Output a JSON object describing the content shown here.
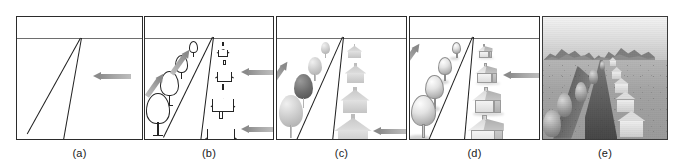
{
  "figure": {
    "width_px": 684,
    "height_px": 167,
    "background_color": "#ffffff",
    "line_color": "#1d1d1d",
    "horizon_color": "#6e6e6e",
    "arrow_color": "#8d8d8d"
  },
  "panels": [
    {
      "id": "a",
      "caption": "(a)",
      "description": "Perspective wireframe: horizon line with two converging road edges meeting at a vanishing point",
      "x": 16,
      "width": 127,
      "style": "wireframe",
      "has_horizon": true,
      "has_road": true,
      "objects": {
        "trees": 0,
        "houses": 0
      },
      "arrows": [
        {
          "type": "horizontal",
          "direction": "left",
          "label": "view-direction-arrow"
        }
      ]
    },
    {
      "id": "b",
      "caption": "(b)",
      "description": "Line-art stage: outline trees on the left of the road, outline houses on the right",
      "x": 144,
      "width": 130,
      "style": "line-art",
      "has_horizon": true,
      "has_road": true,
      "objects": {
        "trees": 4,
        "houses": 4
      },
      "arrows": [
        {
          "type": "diagonal",
          "direction": "down-right",
          "label": "light-arrow-upper"
        },
        {
          "type": "diagonal",
          "direction": "down-right",
          "label": "light-arrow-lower"
        },
        {
          "type": "horizontal",
          "direction": "left",
          "label": "view-arrow-upper"
        },
        {
          "type": "horizontal",
          "direction": "left",
          "label": "view-arrow-lower"
        }
      ]
    },
    {
      "id": "c",
      "caption": "(c)",
      "description": "Soft silhouette / flat shading stage: grey filled trees and houses, one tree darkly shaded",
      "x": 276,
      "width": 131,
      "style": "soft-silhouette",
      "has_horizon": true,
      "has_road": true,
      "objects": {
        "trees": 4,
        "houses": 4
      },
      "arrows": [
        {
          "type": "diagonal",
          "direction": "down-right",
          "label": "light-arrow"
        },
        {
          "type": "horizontal",
          "direction": "left",
          "label": "view-arrow"
        }
      ]
    },
    {
      "id": "d",
      "caption": "(d)",
      "description": "Fully shaded 3D stage: volumetric trees and gabled houses with cast shadows",
      "x": 409,
      "width": 131,
      "style": "shaded-3d",
      "has_horizon": true,
      "has_road": true,
      "objects": {
        "trees": 4,
        "houses": 4
      },
      "arrows": [
        {
          "type": "diagonal",
          "direction": "down-right",
          "label": "light-arrow"
        },
        {
          "type": "horizontal",
          "direction": "left",
          "label": "view-arrow"
        }
      ]
    },
    {
      "id": "e",
      "caption": "(e)",
      "description": "Final photorealistic grayscale render: gradient sky, mountain range on the horizon, textured speckled ground, dark road receding to the vanishing point, trees at left casting long shadows and light buildings at right",
      "x": 542,
      "width": 126,
      "style": "photorealistic",
      "has_horizon": true,
      "has_road": true,
      "objects": {
        "trees": 5,
        "houses": 6,
        "mountains": 5
      },
      "arrows": []
    }
  ]
}
